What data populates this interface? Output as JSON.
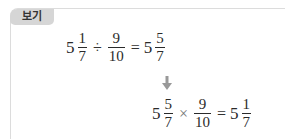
{
  "label": "보기",
  "equation1": {
    "mixed1": {
      "whole": "5",
      "num": "1",
      "den": "7"
    },
    "op1": "÷",
    "frac2": {
      "num": "9",
      "den": "10"
    },
    "op2": "=",
    "result": {
      "whole": "5",
      "num": "5",
      "den": "7"
    }
  },
  "arrow_icon": "down-arrow",
  "equation2": {
    "mixed1": {
      "whole": "5",
      "num": "5",
      "den": "7"
    },
    "op1": "×",
    "frac2": {
      "num": "9",
      "den": "10"
    },
    "op2": "=",
    "result": {
      "whole": "5",
      "num": "1",
      "den": "7"
    }
  },
  "colors": {
    "border": "#dcdcdc",
    "tag_bg": "#d6d6d6",
    "arrow": "#999999"
  }
}
